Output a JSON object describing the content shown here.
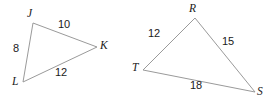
{
  "figure": {
    "background_color": "#ffffff",
    "stroke_color": "#9a9a9a",
    "text_color": "#1a1a1a",
    "stroke_width": 1
  },
  "triangles": [
    {
      "name": "triangle-jkl",
      "vertices": [
        {
          "label": "J",
          "x": 33,
          "y": 23,
          "label_x": 27,
          "label_y": 8
        },
        {
          "label": "K",
          "x": 97,
          "y": 47,
          "label_x": 100,
          "label_y": 40
        },
        {
          "label": "L",
          "x": 23,
          "y": 82,
          "label_x": 12,
          "label_y": 76
        }
      ],
      "sides": [
        {
          "name": "JK",
          "label": "10",
          "label_x": 58,
          "label_y": 19
        },
        {
          "name": "JL",
          "label": "8",
          "label_x": 13,
          "label_y": 43
        },
        {
          "name": "LK",
          "label": "12",
          "label_x": 55,
          "label_y": 67
        }
      ]
    },
    {
      "name": "triangle-rst",
      "vertices": [
        {
          "label": "R",
          "x": 195,
          "y": 18,
          "label_x": 189,
          "label_y": 3
        },
        {
          "label": "S",
          "x": 255,
          "y": 92,
          "label_x": 257,
          "label_y": 86
        },
        {
          "label": "T",
          "x": 143,
          "y": 70,
          "label_x": 132,
          "label_y": 62
        }
      ],
      "sides": [
        {
          "name": "TR",
          "label": "12",
          "label_x": 148,
          "label_y": 28
        },
        {
          "name": "RS",
          "label": "15",
          "label_x": 222,
          "label_y": 36
        },
        {
          "name": "TS",
          "label": "18",
          "label_x": 190,
          "label_y": 80
        }
      ]
    }
  ]
}
